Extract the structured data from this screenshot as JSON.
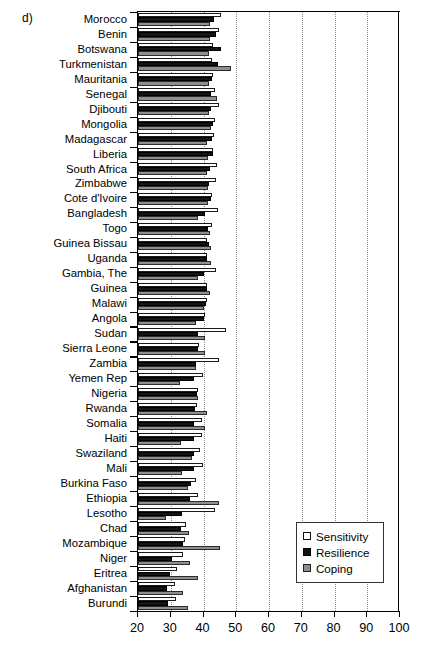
{
  "panel": {
    "label": "d)"
  },
  "legend": {
    "position": "bottom-right",
    "items": [
      {
        "label": "Sensitivity",
        "swatch": "open-white-square",
        "color": "#ffffff"
      },
      {
        "label": "Resilience",
        "swatch": "filled-black-square",
        "color": "#141414"
      },
      {
        "label": "Coping",
        "swatch": "filled-gray-square",
        "color": "#8e8e8e"
      }
    ]
  },
  "chart_data": {
    "type": "bar",
    "orientation": "horizontal",
    "title": "",
    "subtitle": "",
    "xlabel": "",
    "ylabel": "",
    "xlim": [
      20,
      100
    ],
    "xticks": [
      20,
      30,
      40,
      50,
      60,
      70,
      80,
      90,
      100
    ],
    "grid": "vertical-dotted",
    "bar_baseline": 20,
    "categories": [
      "Morocco",
      "Benin",
      "Botswana",
      "Turkmenistan",
      "Mauritania",
      "Senegal",
      "Djibouti",
      "Mongolia",
      "Madagascar",
      "Liberia",
      "South Africa",
      "Zimbabwe",
      "Cote d'Ivoire",
      "Bangladesh",
      "Togo",
      "Guinea Bissau",
      "Uganda",
      "Gambia, The",
      "Guinea",
      "Malawi",
      "Angola",
      "Sudan",
      "Sierra Leone",
      "Zambia",
      "Yemen Rep",
      "Nigeria",
      "Rwanda",
      "Somalia",
      "Haiti",
      "Swaziland",
      "Mali",
      "Burkina Faso",
      "Ethiopia",
      "Lesotho",
      "Chad",
      "Mozambique",
      "Niger",
      "Eritrea",
      "Afghanistan",
      "Burundi"
    ],
    "series": [
      {
        "name": "Sensitivity",
        "color": "#ffffff",
        "values": [
          45.2,
          44.8,
          43.0,
          42.6,
          42.8,
          43.4,
          44.6,
          43.5,
          43.2,
          43.0,
          44.2,
          43.9,
          42.6,
          44.5,
          42.6,
          41.2,
          41.0,
          43.8,
          41.0,
          41.0,
          40.4,
          46.8,
          38.6,
          44.8,
          39.8,
          38.2,
          38.0,
          39.6,
          39.6,
          38.8,
          39.8,
          37.8,
          38.2,
          43.4,
          34.6,
          34.2,
          33.8,
          31.8,
          31.4,
          31.6
        ]
      },
      {
        "name": "Resilience",
        "color": "#141414",
        "values": [
          43.2,
          43.8,
          45.2,
          44.4,
          42.6,
          42.2,
          42.4,
          42.8,
          42.6,
          42.8,
          42.0,
          41.6,
          42.4,
          40.6,
          41.4,
          41.6,
          41.2,
          40.0,
          41.0,
          40.8,
          40.2,
          38.2,
          38.4,
          37.8,
          37.2,
          38.0,
          37.4,
          37.0,
          37.2,
          37.2,
          37.0,
          36.2,
          35.8,
          33.4,
          33.0,
          33.6,
          30.4,
          29.8,
          29.0,
          29.2
        ]
      },
      {
        "name": "Coping",
        "color": "#8e8e8e",
        "values": [
          42.0,
          42.0,
          41.8,
          48.4,
          41.6,
          44.2,
          41.6,
          42.2,
          41.0,
          41.4,
          41.0,
          41.4,
          41.4,
          38.2,
          42.0,
          42.2,
          42.4,
          38.4,
          42.0,
          40.0,
          37.6,
          40.6,
          40.6,
          37.6,
          32.8,
          38.4,
          41.2,
          40.4,
          33.0,
          36.4,
          33.4,
          35.4,
          44.6,
          28.4,
          35.6,
          45.0,
          36.0,
          38.4,
          33.6,
          35.2
        ]
      }
    ]
  }
}
